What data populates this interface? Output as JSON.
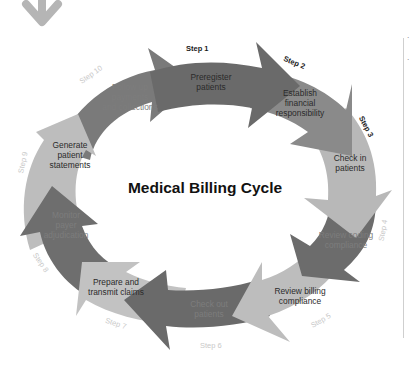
{
  "diagram": {
    "title": "Medical Billing Cycle",
    "colors": {
      "dark": "#6a6a6a",
      "medium": "#8a8a8a",
      "light": "#bdbdbd",
      "decor_arrow": "#b5b5b5",
      "side_rule": "#cfcfcf"
    },
    "steps": [
      {
        "step": "Step 1",
        "label_lines": [
          "Preregister",
          "patients"
        ]
      },
      {
        "step": "Step 2",
        "label_lines": [
          "Establish",
          "financial",
          "responsibility"
        ]
      },
      {
        "step": "Step 3",
        "label_lines": [
          "Check in",
          "patients"
        ]
      },
      {
        "step": "Step 4",
        "label_lines": [
          "Review coding",
          "compliance"
        ]
      },
      {
        "step": "Step 5",
        "label_lines": [
          "Review billing",
          "compliance"
        ]
      },
      {
        "step": "Step 6",
        "label_lines": [
          "Check out",
          "patients"
        ]
      },
      {
        "step": "Step 7",
        "label_lines": [
          "Prepare and",
          "transmit claims"
        ]
      },
      {
        "step": "Step 8",
        "label_lines": [
          "Monitor",
          "payer",
          "adjudication"
        ]
      },
      {
        "step": "Step 9",
        "label_lines": [
          "Generate",
          "patient",
          "statements"
        ]
      },
      {
        "step": "Step 10",
        "label_lines": [
          "Follow up",
          "payments",
          "and collections"
        ]
      }
    ]
  },
  "side_panel": {
    "marks": [
      "·",
      "·"
    ]
  }
}
